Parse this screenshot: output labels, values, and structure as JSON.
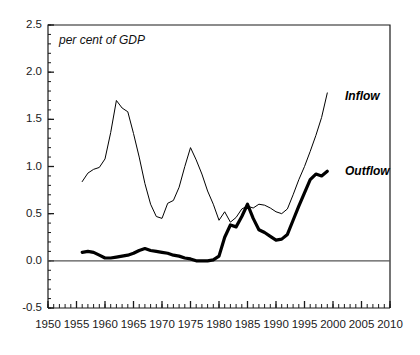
{
  "chart_data": {
    "type": "line",
    "title": "",
    "subtitle": "",
    "annotation": "per cent of GDP",
    "xlabel": "",
    "ylabel": "",
    "xlim": [
      1950,
      2010
    ],
    "ylim": [
      -0.5,
      2.5
    ],
    "xticks": [
      1950,
      1955,
      1960,
      1965,
      1970,
      1975,
      1980,
      1985,
      1990,
      1995,
      2000,
      2005,
      2010
    ],
    "xtick_labels": [
      "1950",
      "1955",
      "1960",
      "1965",
      "1970",
      "1975",
      "1980",
      "1985",
      "1990",
      "1995",
      "2000",
      "2005",
      "2010"
    ],
    "yticks": [
      -0.5,
      0.0,
      0.5,
      1.0,
      1.5,
      2.0,
      2.5
    ],
    "ytick_labels": [
      "-0.5",
      "0.0",
      "0.5",
      "1.0",
      "1.5",
      "2.0",
      "2.5"
    ],
    "x_minor_tick_step": 1,
    "y_minor_tick_step": 0.1,
    "grid": false,
    "zero_line": 0.0,
    "legend_position": "inline-right",
    "series": [
      {
        "name": "Inflow",
        "style": "thin",
        "color": "#000000",
        "linewidth": 1.0,
        "x": [
          1956,
          1957,
          1958,
          1959,
          1960,
          1961,
          1962,
          1963,
          1964,
          1965,
          1966,
          1967,
          1968,
          1969,
          1970,
          1971,
          1972,
          1973,
          1974,
          1975,
          1976,
          1977,
          1978,
          1979,
          1980,
          1981,
          1982,
          1983,
          1984,
          1985,
          1986,
          1987,
          1988,
          1989,
          1990,
          1991,
          1992,
          1993,
          1994,
          1995,
          1996,
          1997,
          1998,
          1999
        ],
        "values": [
          0.84,
          0.93,
          0.97,
          0.99,
          1.08,
          1.36,
          1.7,
          1.62,
          1.58,
          1.35,
          1.1,
          0.82,
          0.6,
          0.47,
          0.45,
          0.61,
          0.64,
          0.78,
          1.0,
          1.2,
          1.07,
          0.92,
          0.74,
          0.6,
          0.43,
          0.52,
          0.41,
          0.46,
          0.55,
          0.58,
          0.56,
          0.6,
          0.59,
          0.56,
          0.52,
          0.5,
          0.55,
          0.7,
          0.86,
          1.0,
          1.16,
          1.33,
          1.52,
          1.78
        ]
      },
      {
        "name": "Outflow",
        "style": "thick",
        "color": "#000000",
        "linewidth": 3.2,
        "x": [
          1956,
          1957,
          1958,
          1959,
          1960,
          1961,
          1962,
          1963,
          1964,
          1965,
          1966,
          1967,
          1968,
          1969,
          1970,
          1971,
          1972,
          1973,
          1974,
          1975,
          1976,
          1977,
          1978,
          1979,
          1980,
          1981,
          1982,
          1983,
          1984,
          1985,
          1986,
          1987,
          1988,
          1989,
          1990,
          1991,
          1992,
          1993,
          1994,
          1995,
          1996,
          1997,
          1998,
          1999
        ],
        "values": [
          0.09,
          0.1,
          0.09,
          0.06,
          0.03,
          0.03,
          0.04,
          0.05,
          0.06,
          0.08,
          0.11,
          0.13,
          0.11,
          0.1,
          0.09,
          0.08,
          0.06,
          0.05,
          0.03,
          0.02,
          0.0,
          0.0,
          0.0,
          0.01,
          0.05,
          0.25,
          0.38,
          0.36,
          0.47,
          0.6,
          0.45,
          0.33,
          0.3,
          0.26,
          0.22,
          0.23,
          0.28,
          0.43,
          0.58,
          0.72,
          0.86,
          0.92,
          0.9,
          0.95
        ]
      }
    ]
  },
  "labels": {
    "inflow": "Inflow",
    "outflow": "Outflow"
  }
}
